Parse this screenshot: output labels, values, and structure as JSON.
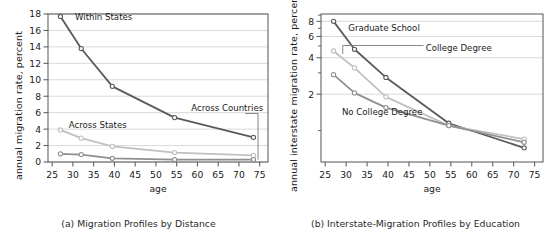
{
  "figure": {
    "width": 554,
    "height": 241,
    "background": "#ffffff"
  },
  "colors": {
    "dark": "#5a5a5a",
    "medium": "#8f8f8f",
    "light": "#c0c0c0",
    "axis": "#555555",
    "grid": "#cfcfcf",
    "text": "#1a1a1a",
    "marker_fill": "#ffffff"
  },
  "panels": [
    {
      "id": "a",
      "caption": "(a) Migration Profiles by Distance",
      "ylabel": "annual migration rate, percent",
      "xlabel": "age"
    },
    {
      "id": "b",
      "caption": "(b) Interstate-Migration Profiles by Education",
      "ylabel": "annual interstate migration rate, percent",
      "xlabel": "age"
    }
  ],
  "chart_data": [
    {
      "type": "line",
      "title": "(a) Migration Profiles by Distance",
      "xlabel": "age",
      "ylabel": "annual migration rate, percent",
      "xlim": [
        24,
        77
      ],
      "ylim": [
        0,
        18
      ],
      "yscale": "linear",
      "xticks": [
        25,
        30,
        35,
        40,
        45,
        50,
        55,
        60,
        65,
        70,
        75
      ],
      "yticks": [
        0,
        2,
        4,
        6,
        8,
        10,
        12,
        14,
        16,
        18
      ],
      "grid": "horizontal",
      "legend": "inline-annotations",
      "x": [
        27,
        32,
        39.5,
        54.5,
        73.5
      ],
      "series": [
        {
          "name": "Within States",
          "color": "#5a5a5a",
          "values": [
            17.7,
            13.8,
            9.2,
            5.4,
            3.0
          ],
          "label_x": 30.5,
          "label_y": 17.6
        },
        {
          "name": "Across States",
          "color": "#c0c0c0",
          "values": [
            3.9,
            2.9,
            1.9,
            1.15,
            0.8
          ],
          "label_x": 29.0,
          "label_y": 4.45
        },
        {
          "name": "Across Countries",
          "color": "#8f8f8f",
          "values": [
            1.0,
            0.9,
            0.45,
            0.3,
            0.3
          ],
          "label_x": 58.5,
          "label_y": 6.6,
          "leader": true
        }
      ]
    },
    {
      "type": "line",
      "title": "(b) Interstate-Migration Profiles by Education",
      "xlabel": "age",
      "ylabel": "annual interstate migration rate, percent",
      "xlim": [
        24,
        77
      ],
      "ylim": [
        0.55,
        9.2
      ],
      "yscale": "log",
      "xticks": [
        25,
        30,
        35,
        40,
        45,
        50,
        55,
        60,
        65,
        70,
        75
      ],
      "yticks": [
        2,
        4,
        6,
        8
      ],
      "yminorticks": [
        1,
        3,
        5,
        7,
        9
      ],
      "grid": "horizontal",
      "legend": "inline-annotations",
      "x": [
        27,
        32,
        39.5,
        54.5,
        72.5
      ],
      "series": [
        {
          "name": "Graduate School",
          "color": "#5a5a5a",
          "values": [
            8.0,
            4.7,
            2.75,
            1.15,
            0.72
          ],
          "label_x": 30.5,
          "label_y": 7.1
        },
        {
          "name": "College Degree",
          "color": "#c0c0c0",
          "values": [
            4.55,
            3.3,
            1.9,
            1.1,
            0.85
          ],
          "label_x": 49.0,
          "label_y": 4.85,
          "leader": true
        },
        {
          "name": "No College Degree",
          "color": "#8f8f8f",
          "values": [
            2.9,
            2.05,
            1.55,
            1.1,
            0.8
          ],
          "label_x": 29.0,
          "label_y": 1.42
        }
      ]
    }
  ]
}
